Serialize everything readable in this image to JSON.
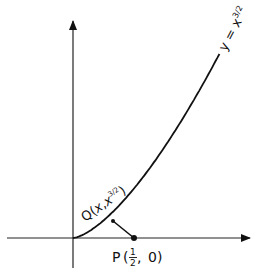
{
  "figure": {
    "curve_label": {
      "lhs": "y",
      "eq": " = ",
      "base": "x",
      "exp": "3/2"
    },
    "q_label": {
      "name": "Q",
      "open": "(",
      "x": "x",
      "comma": ",",
      "base": "x",
      "exp": "3/2",
      "close": ")"
    },
    "p_label": {
      "name": "P",
      "open": "(",
      "num": "1",
      "den": "2",
      "sep": ", ",
      "y": "0",
      "close": ")"
    }
  },
  "chart_data": {
    "type": "line",
    "title": "",
    "xlabel": "",
    "ylabel": "",
    "series": [
      {
        "name": "y = x^(3/2)",
        "function": "x^(3/2)",
        "x_range": [
          0,
          1.2
        ]
      }
    ],
    "points": [
      {
        "name": "Q",
        "label": "Q(x, x^(3/2))",
        "x": "x",
        "y": "x^(3/2)"
      },
      {
        "name": "P",
        "label": "P(1/2, 0)",
        "x": 0.5,
        "y": 0
      }
    ],
    "segments": [
      {
        "from": "Q",
        "to": "P"
      }
    ],
    "grid": false
  }
}
